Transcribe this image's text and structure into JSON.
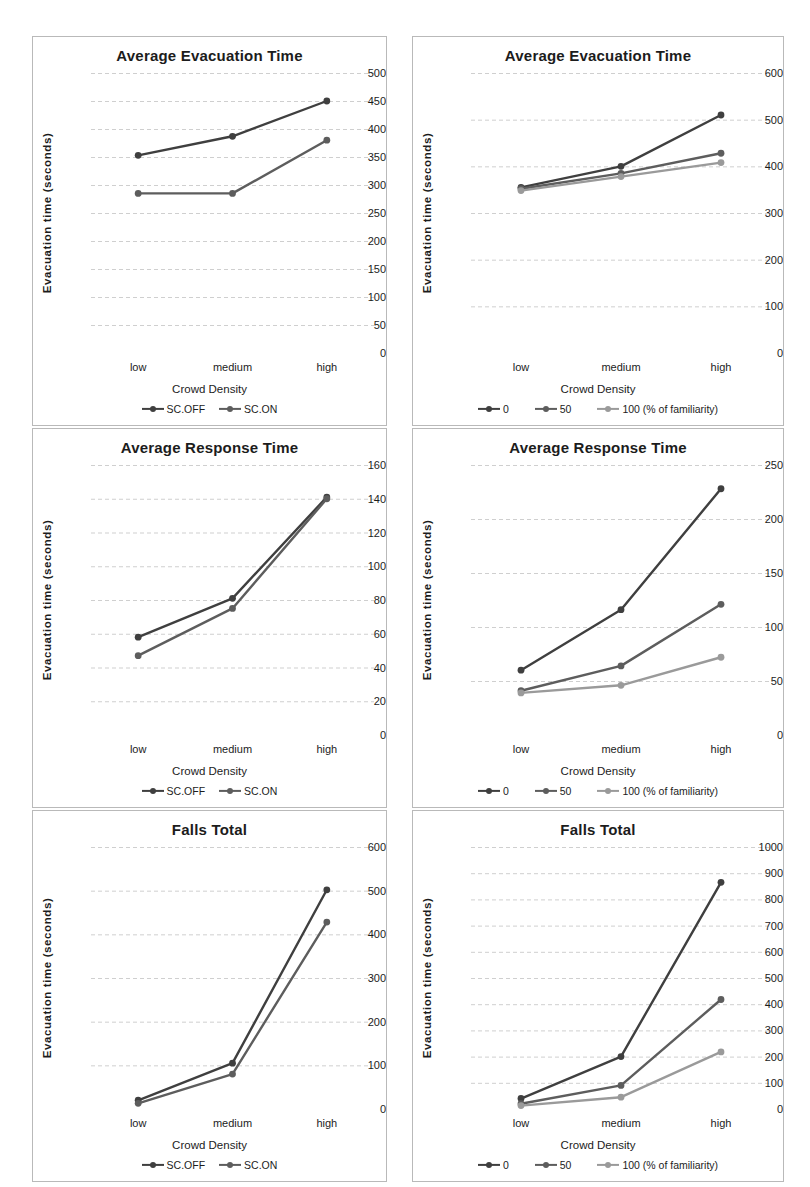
{
  "page": {
    "background": "#ffffff",
    "axis_title_y": "Evacuation time (seconds)",
    "axis_title_x": "Crowd Density",
    "categories": [
      "low",
      "medium",
      "high"
    ]
  },
  "colors": {
    "series_dark": "#3f3f3f",
    "series_mid": "#5d5d5d",
    "series_light": "#9a9a9a",
    "gridline": "#cfcfcf",
    "panel_border": "#b9b9b9",
    "text": "#1c1c1c"
  },
  "chart_data": [
    {
      "id": "evacuation-time-safety-concept",
      "type": "line",
      "title": "Average Evacuation Time",
      "xlabel": "Crowd Density",
      "ylabel": "Evacuation time (seconds)",
      "categories": [
        "low",
        "medium",
        "high"
      ],
      "yticks": [
        0,
        50,
        100,
        150,
        200,
        250,
        300,
        350,
        400,
        450,
        500
      ],
      "ylim": [
        0,
        500
      ],
      "grid": true,
      "legend_position": "bottom",
      "series": [
        {
          "name": "SC.OFF",
          "color": "#3f3f3f",
          "values": [
            353,
            387,
            450
          ]
        },
        {
          "name": "SC.ON",
          "color": "#5d5d5d",
          "values": [
            285,
            285,
            380
          ]
        }
      ]
    },
    {
      "id": "evacuation-time-familiarity",
      "type": "line",
      "title": "Average Evacuation Time",
      "xlabel": "Crowd Density",
      "ylabel": "Evacuation time (seconds)",
      "categories": [
        "low",
        "medium",
        "high"
      ],
      "yticks": [
        0,
        100,
        200,
        300,
        400,
        500,
        600
      ],
      "ylim": [
        0,
        600
      ],
      "grid": true,
      "legend_position": "bottom",
      "series": [
        {
          "name": "0",
          "color": "#3f3f3f",
          "values": [
            355,
            400,
            510
          ]
        },
        {
          "name": "50",
          "color": "#5d5d5d",
          "values": [
            352,
            385,
            428
          ]
        },
        {
          "name": "100 (% of familiarity)",
          "color": "#9a9a9a",
          "values": [
            348,
            378,
            408
          ]
        }
      ]
    },
    {
      "id": "response-time-safety-concept",
      "type": "line",
      "title": "Average Response Time",
      "xlabel": "Crowd Density",
      "ylabel": "Evacuation time (seconds)",
      "categories": [
        "low",
        "medium",
        "high"
      ],
      "yticks": [
        0,
        20,
        40,
        60,
        80,
        100,
        120,
        140,
        160
      ],
      "ylim": [
        0,
        160
      ],
      "grid": true,
      "legend_position": "bottom",
      "series": [
        {
          "name": "SC.OFF",
          "color": "#3f3f3f",
          "values": [
            58,
            81,
            141
          ]
        },
        {
          "name": "SC.ON",
          "color": "#5d5d5d",
          "values": [
            47,
            75,
            140
          ]
        }
      ]
    },
    {
      "id": "response-time-familiarity",
      "type": "line",
      "title": "Average Response Time",
      "xlabel": "Crowd Density",
      "ylabel": "Evacuation time (seconds)",
      "categories": [
        "low",
        "medium",
        "high"
      ],
      "yticks": [
        0,
        50,
        100,
        150,
        200,
        250
      ],
      "ylim": [
        0,
        250
      ],
      "grid": true,
      "legend_position": "bottom",
      "series": [
        {
          "name": "0",
          "color": "#3f3f3f",
          "values": [
            60,
            116,
            228
          ]
        },
        {
          "name": "50",
          "color": "#5d5d5d",
          "values": [
            41,
            64,
            121
          ]
        },
        {
          "name": "100 (% of familiarity)",
          "color": "#9a9a9a",
          "values": [
            39,
            46,
            72
          ]
        }
      ]
    },
    {
      "id": "falls-total-safety-concept",
      "type": "line",
      "title": "Falls Total",
      "xlabel": "Crowd Density",
      "ylabel": "Evacuation time (seconds)",
      "categories": [
        "low",
        "medium",
        "high"
      ],
      "yticks": [
        0,
        100,
        200,
        300,
        400,
        500,
        600
      ],
      "ylim": [
        0,
        600
      ],
      "grid": true,
      "legend_position": "bottom",
      "series": [
        {
          "name": "SC.OFF",
          "color": "#3f3f3f",
          "values": [
            20,
            105,
            502
          ]
        },
        {
          "name": "SC.ON",
          "color": "#5d5d5d",
          "values": [
            13,
            80,
            428
          ]
        }
      ]
    },
    {
      "id": "falls-total-familiarity",
      "type": "line",
      "title": "Falls Total",
      "xlabel": "Crowd Density",
      "ylabel": "Evacuation time (seconds)",
      "categories": [
        "low",
        "medium",
        "high"
      ],
      "yticks": [
        0,
        100,
        200,
        300,
        400,
        500,
        600,
        700,
        800,
        900,
        1000
      ],
      "ylim": [
        0,
        1000
      ],
      "grid": true,
      "legend_position": "bottom",
      "series": [
        {
          "name": "0",
          "color": "#3f3f3f",
          "values": [
            40,
            200,
            865
          ]
        },
        {
          "name": "50",
          "color": "#5d5d5d",
          "values": [
            20,
            90,
            418
          ]
        },
        {
          "name": "100 (% of familiarity)",
          "color": "#9a9a9a",
          "values": [
            13,
            45,
            218
          ]
        }
      ]
    }
  ]
}
